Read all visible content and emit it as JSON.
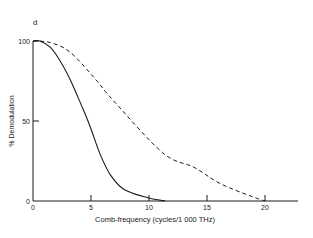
{
  "panel_label": "d",
  "chart_data": {
    "type": "line",
    "title": "",
    "panel": "d",
    "xlabel": "Comb-frequency (cycles/1 000 THz)",
    "ylabel": "% Demodulation",
    "xlim": [
      0,
      23
    ],
    "ylim": [
      0,
      100
    ],
    "x_ticks": [
      0,
      5,
      10,
      15,
      20
    ],
    "y_ticks": [
      0,
      50,
      100
    ],
    "grid": false,
    "legend": null,
    "series": [
      {
        "name": "solid",
        "style": "solid",
        "x": [
          0,
          0.6,
          1.5,
          2.3,
          3.2,
          4.1,
          4.9,
          5.8,
          6.7,
          7.9,
          9.9,
          11.4
        ],
        "y": [
          100,
          100,
          96,
          88,
          76,
          61,
          47,
          29,
          16,
          7,
          2,
          0
        ]
      },
      {
        "name": "dashed",
        "style": "dashed",
        "x": [
          0,
          1.5,
          3.2,
          5.4,
          6.9,
          11.2,
          13.9,
          16.1,
          18.8,
          20
        ],
        "y": [
          100,
          99,
          93,
          76,
          63,
          30,
          21,
          11,
          3,
          0
        ]
      }
    ]
  }
}
